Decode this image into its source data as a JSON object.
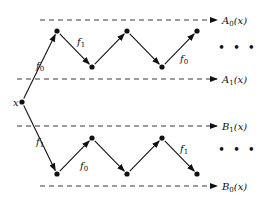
{
  "diagram": {
    "start_node": {
      "label": "x",
      "pos": [
        22,
        102
      ]
    },
    "levels": [
      {
        "name": "A0",
        "label": "A",
        "sub": "0",
        "arg": "(x)",
        "y": 20,
        "x_start": 40
      },
      {
        "name": "A1",
        "label": "A",
        "sub": "1",
        "arg": "(x)",
        "y": 79,
        "x_start": 17
      },
      {
        "name": "B1",
        "label": "B",
        "sub": "1",
        "arg": "(x)",
        "y": 126,
        "x_start": 17
      },
      {
        "name": "B0",
        "label": "B",
        "sub": "0",
        "arg": "(x)",
        "y": 186,
        "x_start": 40
      }
    ],
    "upper_nodes": [
      [
        57,
        31
      ],
      [
        92,
        67
      ],
      [
        127,
        31
      ],
      [
        162,
        67
      ],
      [
        197,
        31
      ]
    ],
    "lower_nodes": [
      [
        57,
        174
      ],
      [
        92,
        138
      ],
      [
        127,
        174
      ],
      [
        162,
        138
      ],
      [
        197,
        174
      ]
    ],
    "edge_labels": [
      {
        "text": "f",
        "sub": "0",
        "pos": [
          36,
          69
        ]
      },
      {
        "text": "f",
        "sub": "1",
        "pos": [
          77,
          45
        ]
      },
      {
        "text": "f",
        "sub": "0",
        "pos": [
          180,
          62
        ]
      },
      {
        "text": "f",
        "sub": "1",
        "pos": [
          36,
          145
        ]
      },
      {
        "text": "f",
        "sub": "0",
        "pos": [
          80,
          169
        ]
      },
      {
        "text": "f",
        "sub": "1",
        "pos": [
          180,
          152
        ]
      }
    ],
    "ellipsis": "• • •",
    "ellipsis_positions": [
      [
        218,
        52
      ],
      [
        218,
        154
      ]
    ]
  }
}
